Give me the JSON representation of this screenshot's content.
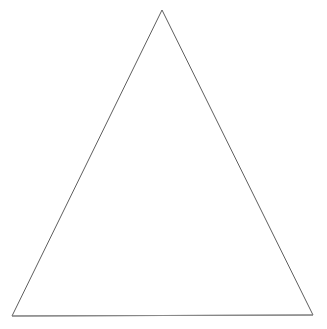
{
  "canvas": {
    "width": 327,
    "height": 329,
    "background_color": "#ffffff",
    "description": "Plain white drawing canvas containing a single unfilled triangle outline"
  },
  "figure": {
    "name": "triangle",
    "kind": "line-drawing",
    "fill": "none",
    "stroke_color": "#5e5e5e",
    "stroke_width": 1,
    "closed": true,
    "vertices": [
      {
        "label": "apex",
        "x": 162,
        "y": 10
      },
      {
        "label": "bottom-right",
        "x": 313,
        "y": 315
      },
      {
        "label": "bottom-left",
        "x": 12,
        "y": 316
      }
    ],
    "points_attr": "162,10 313,315 12,316",
    "edges": [
      {
        "label": "left-edge",
        "from": "apex",
        "to": "bottom-left",
        "stroke_color": "#5e5e5e"
      },
      {
        "label": "right-edge",
        "from": "apex",
        "to": "bottom-right",
        "stroke_color": "#5e5e5e"
      },
      {
        "label": "base-edge",
        "from": "bottom-left",
        "to": "bottom-right",
        "stroke_color": "#8a8a8a"
      }
    ]
  }
}
